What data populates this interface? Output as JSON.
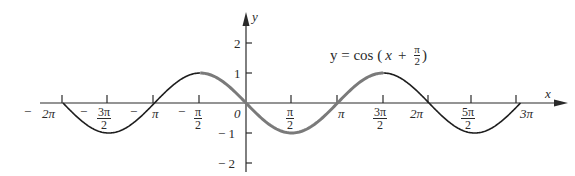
{
  "chart_data": {
    "type": "line",
    "xlabel": "x",
    "ylabel": "y",
    "function": "cos(x + pi/2)",
    "xlim": [
      -6.2832,
      9.4248
    ],
    "ylim": [
      -2,
      2
    ],
    "x_ticks": [
      "-2π",
      "-3π/2",
      "-π",
      "-π/2",
      "0",
      "π/2",
      "π",
      "3π/2",
      "2π",
      "5π/2",
      "3π"
    ],
    "x_tick_values": [
      -6.2832,
      -4.7124,
      -3.1416,
      -1.5708,
      0,
      1.5708,
      3.1416,
      4.7124,
      6.2832,
      7.854,
      9.4248
    ],
    "y_ticks": [
      "2",
      "1",
      "-1",
      "-2"
    ],
    "y_tick_values": [
      2,
      1,
      -1,
      -2
    ],
    "grid": false,
    "legend": null,
    "series": [
      {
        "name": "y = cos(x + π/2)",
        "style": "thin black",
        "x": [
          -6.2832,
          -4.7124,
          -3.1416,
          -1.5708,
          0,
          1.5708,
          3.1416,
          4.7124,
          6.2832,
          7.854,
          9.4248
        ],
        "values": [
          0,
          -1,
          0,
          1,
          0,
          -1,
          0,
          1,
          0,
          -1,
          0
        ]
      },
      {
        "name": "highlighted period",
        "style": "thick gray",
        "x": [
          -1.5708,
          0,
          1.5708,
          3.1416,
          4.7124
        ],
        "values": [
          1,
          0,
          -1,
          0,
          1
        ]
      }
    ]
  },
  "labels": {
    "equation_lhs": "y = cos (",
    "equation_x": "x",
    "equation_plus": "+",
    "equation_num": "π",
    "equation_den": "2",
    "equation_close": ")",
    "x_axis": "x",
    "y_axis": "y",
    "origin": "0",
    "pi": "π",
    "two": "2",
    "minus": "−",
    "neg2pi": "2π",
    "threepi_num": "3π",
    "pi_num": "π",
    "twopi": "2π",
    "fivepi_num": "5π",
    "threepi": "3π",
    "y2": "2",
    "y1": "1",
    "yneg1": "− 1",
    "yneg2": "− 2"
  },
  "colors": {
    "curve": "#1e1e1e",
    "highlight": "#7a7a7a",
    "axis": "#2a2a2a"
  }
}
